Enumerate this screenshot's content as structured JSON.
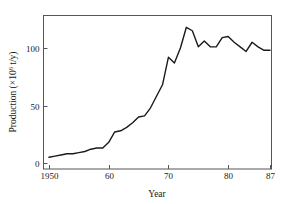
{
  "chart_data": {
    "type": "line",
    "title": "",
    "subtitle": "",
    "xlabel": "Year",
    "ylabel": "Production (×10⁶ t/y)",
    "ylabel_parts": {
      "name": "Production",
      "unit_open": "(×10",
      "unit_exp": "6",
      "unit_close": " t/y)"
    },
    "xlim": [
      1950,
      87
    ],
    "ylim": [
      0,
      125
    ],
    "xticks": [
      1950,
      60,
      70,
      80,
      87
    ],
    "xtick_labels": [
      "1950",
      "60",
      "70",
      "80",
      "87"
    ],
    "yticks": [
      0,
      50,
      100
    ],
    "ytick_labels": [
      "0",
      "50",
      "100"
    ],
    "grid": false,
    "legend": false,
    "legend_position": "none",
    "series": [
      {
        "name": "Production",
        "color": "#1a1a1a",
        "x": [
          1950,
          1951,
          1952,
          1953,
          1954,
          1955,
          1956,
          1957,
          1958,
          1959,
          1960,
          1961,
          1962,
          1963,
          1964,
          1965,
          1966,
          1967,
          1968,
          1969,
          1970,
          1971,
          1972,
          1973,
          1974,
          1975,
          1976,
          1977,
          1978,
          1979,
          1980,
          1981,
          1982,
          1983,
          1984,
          1985,
          1986,
          1987
        ],
        "values": [
          5,
          6,
          7,
          8,
          8,
          9,
          10,
          12,
          13,
          13,
          18,
          27,
          28,
          31,
          35,
          40,
          41,
          48,
          58,
          68,
          92,
          87,
          100,
          118,
          115,
          101,
          106,
          101,
          101,
          109,
          110,
          105,
          101,
          97,
          105,
          101,
          98,
          98
        ]
      }
    ]
  },
  "axes": {
    "frame_color": "#555555",
    "line_color": "#1a1a1a",
    "background": "#ffffff"
  }
}
